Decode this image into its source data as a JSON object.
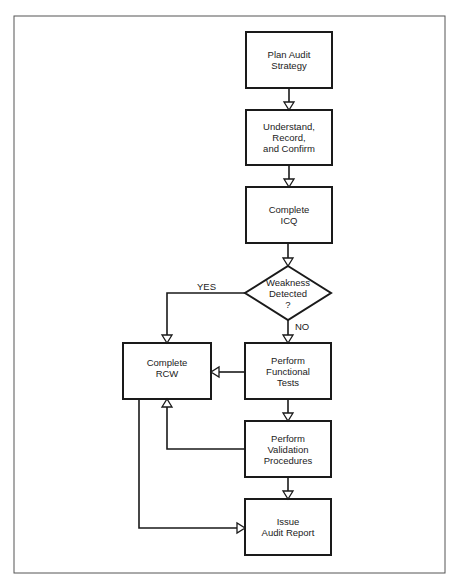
{
  "diagram": {
    "type": "flowchart",
    "nodes": [
      {
        "id": "plan",
        "shape": "rect",
        "label": "Plan Audit\nStrategy"
      },
      {
        "id": "understand",
        "shape": "rect",
        "label": "Understand,\nRecord,\nand Confirm"
      },
      {
        "id": "icq",
        "shape": "rect",
        "label": "Complete\nICQ"
      },
      {
        "id": "weakness",
        "shape": "diamond",
        "label": "Weakness\nDetected\n?"
      },
      {
        "id": "rcw",
        "shape": "rect",
        "label": "Complete\nRCW"
      },
      {
        "id": "functional",
        "shape": "rect",
        "label": "Perform\nFunctional\nTests"
      },
      {
        "id": "validation",
        "shape": "rect",
        "label": "Perform\nValidation\nProcedures"
      },
      {
        "id": "report",
        "shape": "rect",
        "label": "Issue\nAudit Report"
      }
    ],
    "edges": [
      {
        "from": "plan",
        "to": "understand",
        "label": ""
      },
      {
        "from": "understand",
        "to": "icq",
        "label": ""
      },
      {
        "from": "icq",
        "to": "weakness",
        "label": ""
      },
      {
        "from": "weakness",
        "to": "rcw",
        "label": "YES"
      },
      {
        "from": "weakness",
        "to": "functional",
        "label": "NO"
      },
      {
        "from": "functional",
        "to": "rcw",
        "label": ""
      },
      {
        "from": "functional",
        "to": "validation",
        "label": ""
      },
      {
        "from": "validation",
        "to": "rcw",
        "label": ""
      },
      {
        "from": "validation",
        "to": "report",
        "label": ""
      },
      {
        "from": "rcw",
        "to": "report",
        "label": ""
      }
    ],
    "edge_labels": {
      "yes": "YES",
      "no": "NO"
    },
    "colors": {
      "stroke": "#1a1a1a",
      "background": "#ffffff",
      "frame": "#555555"
    }
  }
}
